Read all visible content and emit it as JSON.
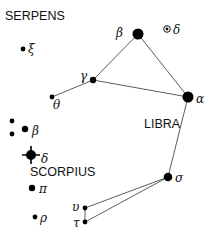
{
  "constellations": [
    {
      "id": "serpens",
      "label": "SERPENS"
    },
    {
      "id": "libra",
      "label": "LIBRA"
    },
    {
      "id": "scorpius",
      "label": "SCORPIUS"
    }
  ],
  "stars": [
    {
      "id": "serpens-xi",
      "constellation": "serpens",
      "greek": "ξ",
      "magnitude_class": "small"
    },
    {
      "id": "libra-beta",
      "constellation": "libra",
      "greek": "β",
      "magnitude_class": "large"
    },
    {
      "id": "libra-delta",
      "constellation": "libra",
      "greek": "δ",
      "magnitude_class": "variable"
    },
    {
      "id": "libra-gamma",
      "constellation": "libra",
      "greek": "γ",
      "magnitude_class": "medium"
    },
    {
      "id": "libra-theta",
      "constellation": "libra",
      "greek": "θ",
      "magnitude_class": "small"
    },
    {
      "id": "libra-alpha",
      "constellation": "libra",
      "greek": "α",
      "magnitude_class": "large"
    },
    {
      "id": "libra-sigma",
      "constellation": "libra",
      "greek": "σ",
      "magnitude_class": "medium-large"
    },
    {
      "id": "libra-upsilon",
      "constellation": "libra",
      "greek": "υ",
      "magnitude_class": "small"
    },
    {
      "id": "libra-tau",
      "constellation": "libra",
      "greek": "τ",
      "magnitude_class": "small"
    },
    {
      "id": "scorpius-unnamed-1",
      "constellation": "scorpius",
      "greek": "",
      "magnitude_class": "small"
    },
    {
      "id": "scorpius-unnamed-2",
      "constellation": "scorpius",
      "greek": "",
      "magnitude_class": "small"
    },
    {
      "id": "scorpius-beta",
      "constellation": "scorpius",
      "greek": "β",
      "magnitude_class": "medium"
    },
    {
      "id": "scorpius-delta",
      "constellation": "scorpius",
      "greek": "δ",
      "magnitude_class": "brightest"
    },
    {
      "id": "scorpius-pi",
      "constellation": "scorpius",
      "greek": "π",
      "magnitude_class": "medium"
    },
    {
      "id": "scorpius-rho",
      "constellation": "scorpius",
      "greek": "ρ",
      "magnitude_class": "small"
    }
  ],
  "connections": [
    [
      "libra-theta",
      "libra-gamma"
    ],
    [
      "libra-gamma",
      "libra-beta"
    ],
    [
      "libra-gamma",
      "libra-alpha"
    ],
    [
      "libra-beta",
      "libra-alpha"
    ],
    [
      "libra-alpha",
      "libra-sigma"
    ],
    [
      "libra-sigma",
      "libra-upsilon"
    ],
    [
      "libra-sigma",
      "libra-tau"
    ],
    [
      "libra-upsilon",
      "libra-tau"
    ]
  ]
}
